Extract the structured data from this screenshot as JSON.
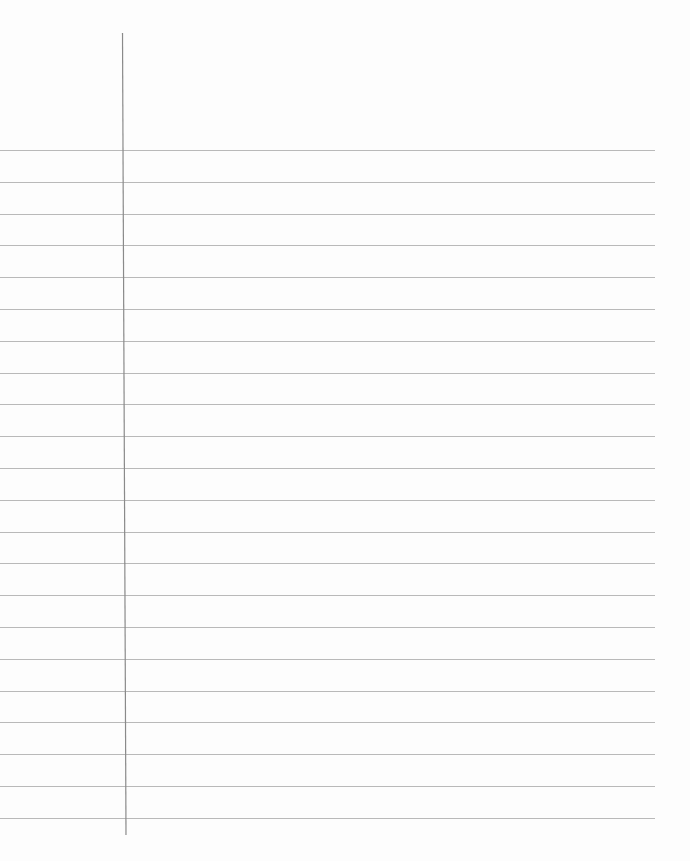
{
  "page": {
    "type": "lined-paper",
    "background_color": "#fdfdfd",
    "rule_color": "#b9b9b9",
    "margin_line_color": "#8a8a8a",
    "rule_count": 22,
    "first_rule_y": 150,
    "rule_spacing": 31.8,
    "rule_end_x": 655,
    "margin_line": {
      "x_top": 122.5,
      "y_top": 33,
      "x_bottom": 126,
      "y_bottom": 835
    }
  }
}
